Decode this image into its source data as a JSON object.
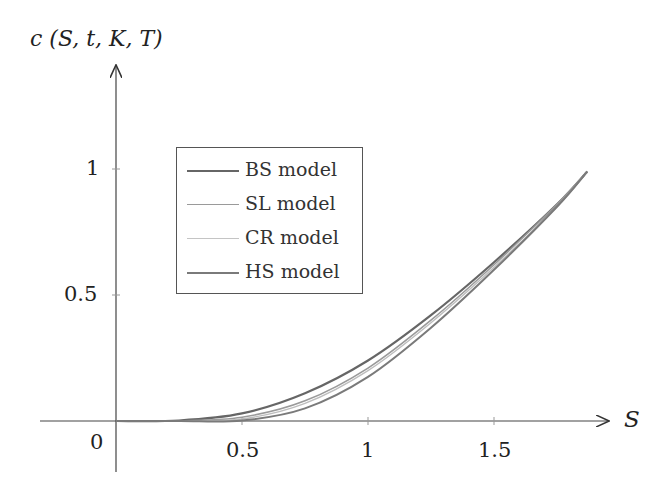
{
  "chart_data": {
    "type": "line",
    "title": "",
    "xlabel": "S",
    "ylabel": "c (S, t, K, T)",
    "xlim": [
      -0.3,
      2.05
    ],
    "ylim": [
      -0.3,
      1.45
    ],
    "x_ticks": [
      "0",
      "0.5",
      "1",
      "1.5"
    ],
    "y_ticks": [
      "0.5",
      "1"
    ],
    "grid": false,
    "legend_position": "upper left",
    "x": [
      0,
      0.25,
      0.5,
      0.75,
      1.0,
      1.25,
      1.5,
      1.75,
      1.87
    ],
    "series": [
      {
        "name": "BS model",
        "color": "#666666",
        "values": [
          0,
          0.002,
          0.03,
          0.11,
          0.24,
          0.42,
          0.63,
          0.86,
          0.99
        ]
      },
      {
        "name": "SL model",
        "color": "#9a9a9a",
        "values": [
          0,
          0.001,
          0.015,
          0.08,
          0.21,
          0.4,
          0.62,
          0.86,
          0.99
        ]
      },
      {
        "name": "CR model",
        "color": "#bdbdbd",
        "values": [
          0,
          0.0,
          0.008,
          0.07,
          0.2,
          0.39,
          0.61,
          0.85,
          0.99
        ]
      },
      {
        "name": "HS model",
        "color": "#7a7a7a",
        "values": [
          0,
          0.0,
          0.002,
          0.05,
          0.175,
          0.37,
          0.6,
          0.85,
          0.99
        ]
      }
    ]
  },
  "axes": {
    "y_label_c": "c",
    "y_label_args": "(S, t, K, T)",
    "x_label": "S",
    "origin": "0",
    "x_tick_05": "0.5",
    "x_tick_1": "1",
    "x_tick_15": "1.5",
    "y_tick_05": "0.5",
    "y_tick_1": "1"
  },
  "legend": {
    "items": [
      {
        "label": "BS model",
        "color": "#666666"
      },
      {
        "label": "SL model",
        "color": "#9a9a9a"
      },
      {
        "label": "CR model",
        "color": "#bdbdbd"
      },
      {
        "label": "HS model",
        "color": "#7a7a7a"
      }
    ]
  }
}
